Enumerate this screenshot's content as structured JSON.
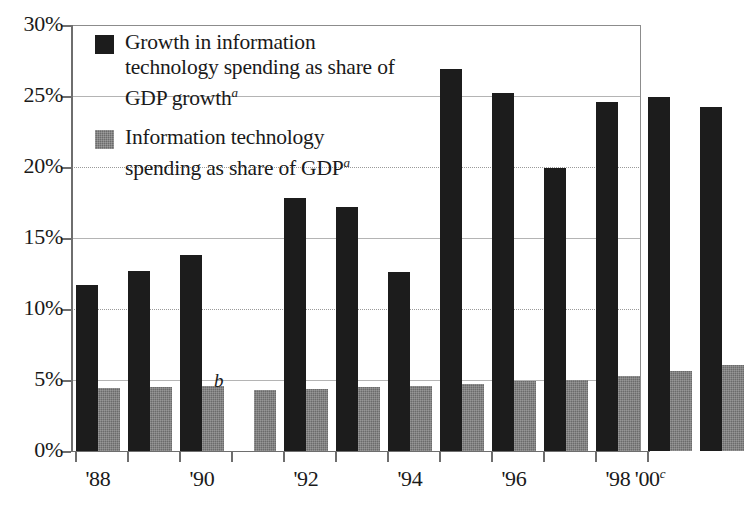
{
  "chart_data": {
    "type": "bar",
    "title": "",
    "xlabel": "",
    "ylabel": "",
    "ylim": [
      0,
      30
    ],
    "ytick_labels": [
      "0%",
      "5%",
      "10%",
      "15%",
      "20%",
      "25%",
      "30%"
    ],
    "ytick_values": [
      0,
      5,
      10,
      15,
      20,
      25,
      30
    ],
    "grid": true,
    "legend_position": "upper-left-inside",
    "categories": [
      "1988",
      "1989",
      "1990",
      "1991",
      "1992",
      "1993",
      "1994",
      "1995",
      "1996",
      "1997",
      "1998",
      "1999",
      "2000"
    ],
    "xtick_labels": [
      "'88",
      "",
      "'90",
      "",
      "'92",
      "",
      "'94",
      "",
      "'96",
      "",
      "'98",
      "",
      "'00"
    ],
    "xtick_label_superscripts": [
      "",
      "",
      "",
      "",
      "",
      "",
      "",
      "",
      "",
      "",
      "",
      "",
      "c"
    ],
    "series": [
      {
        "name": "Growth in information technology spending as share of GDP growth",
        "color": "#1c1c1c",
        "footnote_marker": "a",
        "values": [
          11.7,
          12.7,
          13.8,
          null,
          17.8,
          17.2,
          12.6,
          26.9,
          25.2,
          19.9,
          24.6,
          24.9,
          24.2
        ]
      },
      {
        "name": "Information technology spending as share of GDP",
        "color": "#6b6b6b",
        "footnote_marker": "a",
        "values": [
          4.45,
          4.5,
          4.55,
          4.3,
          4.35,
          4.5,
          4.6,
          4.75,
          4.95,
          5.0,
          5.25,
          5.6,
          6.05
        ]
      }
    ],
    "annotations": [
      {
        "text": "b",
        "category": "1991",
        "series": "Growth in information technology spending as share of GDP growth",
        "note": "value not available"
      }
    ]
  },
  "legend": {
    "entries": [
      {
        "label": "Growth in information technology spending as share of GDP growth",
        "superscript": "a",
        "swatch": "dark"
      },
      {
        "label": "Information technology spending as share of GDP",
        "superscript": "a",
        "swatch": "gray"
      }
    ]
  },
  "axis": {
    "y_labels": [
      "30%",
      "25%",
      "20%",
      "15%",
      "10%",
      "5%",
      "0%"
    ],
    "x_labels": [
      "'88",
      "'90",
      "'92",
      "'94",
      "'96",
      "'98",
      "'00"
    ],
    "x_last_superscript": "c"
  },
  "markers": {
    "missing_data": "b"
  },
  "colors": {
    "series_dark": "#1c1c1c",
    "series_gray": "#6b6b6b",
    "grid": "#b4b4b4",
    "axis": "#6e6e6e",
    "text": "#1a1a1a",
    "background": "#ffffff"
  }
}
